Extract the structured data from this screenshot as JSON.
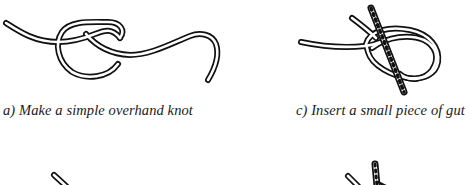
{
  "figure": {
    "panels": [
      {
        "id": "a",
        "caption": "a) Make a simple overhand knot",
        "illustration": "overhand-knot-icon"
      },
      {
        "id": "c",
        "caption": "c) Insert a small piece of gut",
        "illustration": "knot-with-gut-piece-icon"
      },
      {
        "id": "b",
        "caption": "",
        "illustration": "knot-partial-bottom-left-icon"
      },
      {
        "id": "d",
        "caption": "",
        "illustration": "knot-partial-bottom-right-icon"
      }
    ],
    "colors": {
      "ink": "#111111",
      "background": "#ffffff"
    }
  }
}
